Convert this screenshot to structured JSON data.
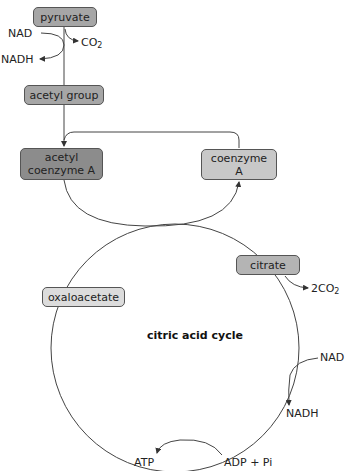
{
  "diagram": {
    "title": "citric acid cycle",
    "colors": {
      "pyruvate": "#a6a6a6",
      "acetyl_group": "#a6a6a6",
      "acetyl_coa": "#8c8c8c",
      "coenzyme_a": "#c8c8c8",
      "citrate": "#b4b4b4",
      "oxaloacetate": "#dcdcdc",
      "line": "#444444"
    },
    "nodes": {
      "pyruvate": "pyruvate",
      "acetyl_group": "acetyl group",
      "acetyl_coa_line1": "acetyl",
      "acetyl_coa_line2": "coenzyme A",
      "coenzyme_a_line1": "coenzyme",
      "coenzyme_a_line2": "A",
      "citrate": "citrate",
      "oxaloacetate": "oxaloacetate"
    },
    "labels": {
      "nad_top": "NAD",
      "nadh_top": "NADH",
      "co2_top": "CO",
      "co2_top_sub": "2",
      "two_co2": "2CO",
      "two_co2_sub": "2",
      "nad_right": "NAD",
      "nadh_right": "NADH",
      "atp": "ATP",
      "adp_pi": "ADP + Pi"
    }
  }
}
